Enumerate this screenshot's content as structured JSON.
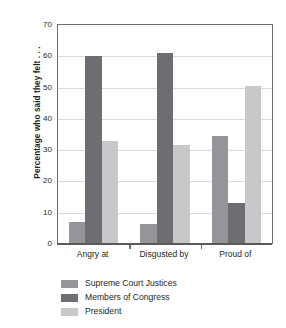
{
  "chart_data": {
    "type": "bar",
    "title": "",
    "xlabel": "",
    "ylabel": "Percentage who said they felt . . .",
    "ylim": [
      0,
      70
    ],
    "ytick_step": 10,
    "yticks": [
      "0",
      "10",
      "20",
      "30",
      "40",
      "50",
      "60",
      "70"
    ],
    "grid": true,
    "legend_position": "bottom-left",
    "categories": [
      "Angry at",
      "Disgusted by",
      "Proud of"
    ],
    "series": [
      {
        "name": "Supreme Court Justices",
        "color": "#939598",
        "values": [
          7,
          6.5,
          34.5
        ]
      },
      {
        "name": "Members of Congress",
        "color": "#6d6e71",
        "values": [
          60,
          61,
          13
        ]
      },
      {
        "name": "President",
        "color": "#c7c8ca",
        "values": [
          33,
          31.5,
          50.5
        ]
      }
    ]
  },
  "legend": {
    "items": [
      {
        "label": "Supreme Court Justices",
        "swatch": "sc"
      },
      {
        "label": "Members of Congress",
        "swatch": "cong"
      },
      {
        "label": "President",
        "swatch": "pres"
      }
    ]
  }
}
